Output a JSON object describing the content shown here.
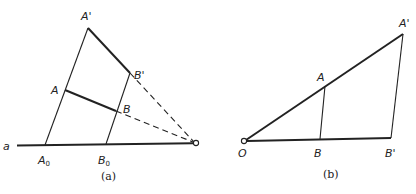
{
  "figure_a": {
    "caption": "(a)",
    "labels": {
      "line": "a",
      "A_prime": "A'",
      "B_prime": "B'",
      "A": "A",
      "B": "B",
      "A0_main": "A",
      "A0_sub": "0",
      "B0_main": "B",
      "B0_sub": "0"
    },
    "points": {
      "line_start": [
        17,
        145
      ],
      "O": [
        196,
        143
      ],
      "A0": [
        45,
        145
      ],
      "A": [
        65,
        90
      ],
      "A_prime": [
        88,
        28
      ],
      "B0": [
        106,
        144
      ],
      "B": [
        116,
        111
      ],
      "B_prime": [
        130,
        73
      ]
    }
  },
  "figure_b": {
    "caption": "(b)",
    "labels": {
      "O": "O",
      "A": "A",
      "B": "B",
      "A_prime": "A'",
      "B_prime": "B'"
    },
    "points": {
      "O": [
        244,
        141
      ],
      "A": [
        325,
        86
      ],
      "B": [
        320,
        139
      ],
      "A_prime": [
        403,
        34
      ],
      "B_prime": [
        391,
        138
      ]
    }
  },
  "colors": {
    "ink": "#222222",
    "background": "#ffffff"
  }
}
